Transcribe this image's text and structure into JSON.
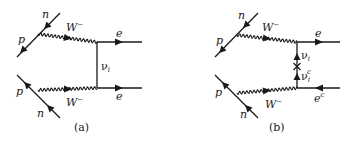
{
  "figure": {
    "panels": [
      {
        "id": "a",
        "caption": "(a)",
        "upper_vertex": {
          "incoming": "n",
          "outgoing": "p"
        },
        "lower_vertex": {
          "incoming": "n",
          "outgoing": "p"
        },
        "boson_upper": {
          "name": "W",
          "charge": "−"
        },
        "boson_lower": {
          "name": "W",
          "charge": "−"
        },
        "exchange": {
          "name": "ν",
          "subscript": "i"
        },
        "lepton_upper": {
          "name": "e",
          "superscript": ""
        },
        "lepton_lower": {
          "name": "e",
          "superscript": ""
        }
      },
      {
        "id": "b",
        "caption": "(b)",
        "upper_vertex": {
          "incoming": "n",
          "outgoing": "p"
        },
        "lower_vertex": {
          "incoming": "n",
          "outgoing": "p"
        },
        "boson_upper": {
          "name": "W",
          "charge": "−"
        },
        "boson_lower": {
          "name": "W",
          "charge": "−"
        },
        "exchange_upper": {
          "name": "ν",
          "subscript": "i"
        },
        "exchange_lower": {
          "name": "ν",
          "subscript": "i",
          "superscript": "c"
        },
        "mass_insertion": "×",
        "lepton_upper": {
          "name": "e",
          "superscript": ""
        },
        "lepton_lower": {
          "name": "e",
          "superscript": "c"
        }
      }
    ]
  }
}
